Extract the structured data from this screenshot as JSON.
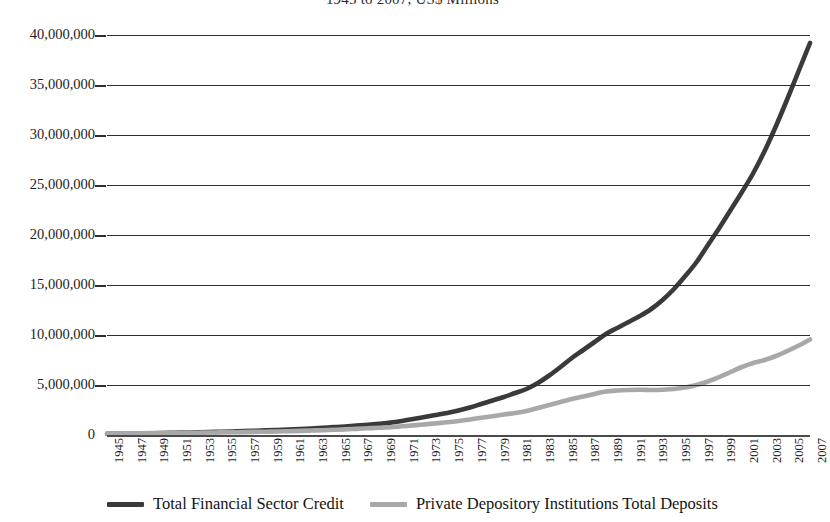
{
  "chart_data": {
    "type": "line",
    "title": "1945 to 2007, US$ Millions",
    "xlabel": "",
    "ylabel": "",
    "units": "US$ Millions",
    "grid": true,
    "legend_position": "bottom",
    "xlim": [
      1945,
      2007
    ],
    "ylim": [
      0,
      40000000
    ],
    "ytick_labels": [
      "40,000,000",
      "35,000,000",
      "30,000,000",
      "25,000,000",
      "20,000,000",
      "15,000,000",
      "10,000,000",
      "5,000,000",
      "0"
    ],
    "ytick_values": [
      40000000,
      35000000,
      30000000,
      25000000,
      20000000,
      15000000,
      10000000,
      5000000,
      0
    ],
    "xtick_labels": [
      "1945",
      "1947",
      "1949",
      "1951",
      "1953",
      "1955",
      "1957",
      "1959",
      "1961",
      "1963",
      "1965",
      "1967",
      "1969",
      "1971",
      "1973",
      "1975",
      "1977",
      "1979",
      "1981",
      "1983",
      "1985",
      "1987",
      "1989",
      "1991",
      "1993",
      "1995",
      "1997",
      "1999",
      "2001",
      "2003",
      "2005",
      "2007"
    ],
    "x": [
      1945,
      1946,
      1947,
      1948,
      1949,
      1950,
      1951,
      1952,
      1953,
      1954,
      1955,
      1956,
      1957,
      1958,
      1959,
      1960,
      1961,
      1962,
      1963,
      1964,
      1965,
      1966,
      1967,
      1968,
      1969,
      1970,
      1971,
      1972,
      1973,
      1974,
      1975,
      1976,
      1977,
      1978,
      1979,
      1980,
      1981,
      1982,
      1983,
      1984,
      1985,
      1986,
      1987,
      1988,
      1989,
      1990,
      1991,
      1992,
      1993,
      1994,
      1995,
      1996,
      1997,
      1998,
      1999,
      2000,
      2001,
      2002,
      2003,
      2004,
      2005,
      2006,
      2007
    ],
    "series": [
      {
        "name": "Total Financial Sector Credit",
        "color": "#3a3a3a",
        "values": [
          120000,
          135000,
          150000,
          165000,
          180000,
          200000,
          220000,
          245000,
          270000,
          295000,
          325000,
          355000,
          385000,
          420000,
          460000,
          500000,
          545000,
          595000,
          650000,
          715000,
          785000,
          855000,
          935000,
          1030000,
          1130000,
          1240000,
          1400000,
          1590000,
          1800000,
          2000000,
          2200000,
          2450000,
          2750000,
          3100000,
          3450000,
          3800000,
          4200000,
          4600000,
          5200000,
          5950000,
          6800000,
          7700000,
          8500000,
          9300000,
          10100000,
          10700000,
          11300000,
          11900000,
          12600000,
          13500000,
          14600000,
          15900000,
          17300000,
          19000000,
          20700000,
          22500000,
          24300000,
          26200000,
          28400000,
          30900000,
          33600000,
          36400000,
          39200000
        ]
      },
      {
        "name": "Private Depository Institutions Total Deposits",
        "color": "#a8a8a8",
        "values": [
          150000,
          160000,
          170000,
          178000,
          185000,
          195000,
          205000,
          218000,
          232000,
          246000,
          260000,
          275000,
          290000,
          310000,
          330000,
          350000,
          380000,
          410000,
          445000,
          480000,
          520000,
          560000,
          615000,
          670000,
          720000,
          780000,
          870000,
          960000,
          1060000,
          1160000,
          1270000,
          1400000,
          1550000,
          1720000,
          1880000,
          2050000,
          2200000,
          2400000,
          2700000,
          3000000,
          3300000,
          3600000,
          3850000,
          4100000,
          4350000,
          4450000,
          4500000,
          4520000,
          4500000,
          4530000,
          4600000,
          4750000,
          5000000,
          5350000,
          5800000,
          6300000,
          6800000,
          7200000,
          7500000,
          7900000,
          8400000,
          8950000,
          9550000
        ]
      }
    ]
  },
  "legend": {
    "items": [
      {
        "label": "Total Financial Sector Credit",
        "color": "#3a3a3a"
      },
      {
        "label": "Private Depository Institutions Total Deposits",
        "color": "#a8a8a8"
      }
    ]
  }
}
